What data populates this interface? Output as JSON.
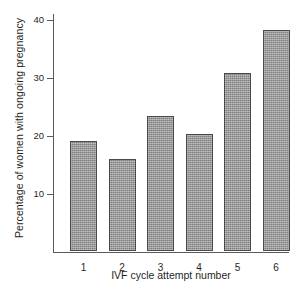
{
  "chart_data": {
    "type": "bar",
    "title": "",
    "categories": [
      "1",
      "2",
      "3",
      "4",
      "5",
      "6"
    ],
    "values": [
      19.0,
      15.8,
      23.3,
      20.2,
      30.6,
      38.0
    ],
    "series": [
      {
        "name": "Percentage of women with ongoing pregnancy",
        "values": [
          19.0,
          15.8,
          23.3,
          20.2,
          30.6,
          38.0
        ]
      }
    ],
    "xlabel": "IVF cycle attempt number",
    "ylabel": "Percentage of women with ongoing pregnancy",
    "ylim": [
      0,
      41
    ],
    "yticks": [
      10,
      20,
      30,
      40
    ],
    "ytick_labels": [
      "10",
      "20",
      "30",
      "40"
    ],
    "grid": false,
    "legend": false,
    "bar_color": "#9b9b9b",
    "bar_edge_color": "#4a4a4a",
    "axis_color": "#5a5a5a",
    "background": "#ffffff"
  }
}
